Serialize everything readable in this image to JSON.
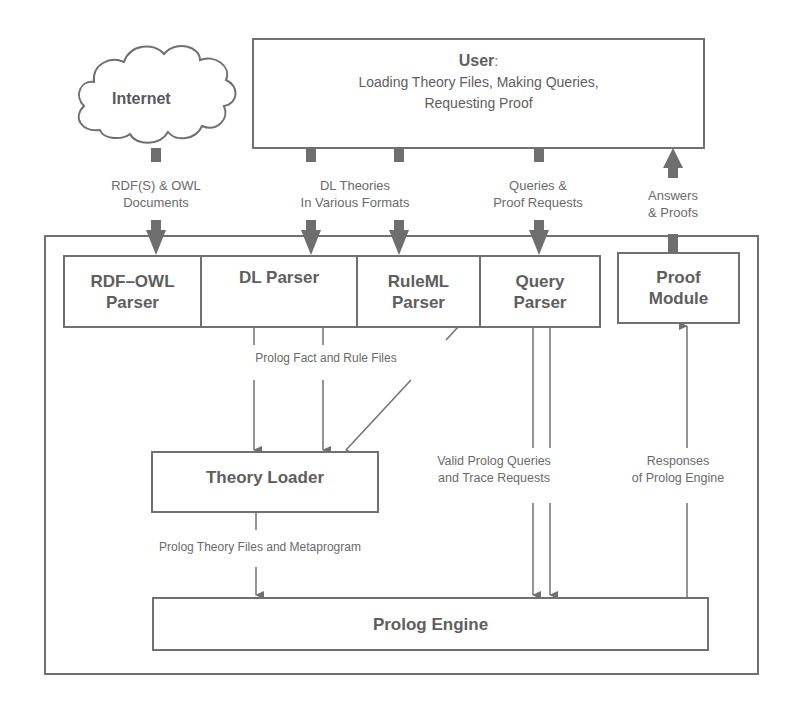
{
  "diagram": {
    "type": "system-architecture",
    "external": {
      "internet": {
        "label": "Internet",
        "shape": "cloud"
      },
      "user": {
        "title": "User",
        "title_suffix": ":",
        "line1": "Loading Theory Files, Making Queries,",
        "line2": "Requesting Proof"
      }
    },
    "components": {
      "rdf_owl_parser": {
        "line1": "RDF–OWL",
        "line2": "Parser"
      },
      "dl_parser": {
        "line1": "DL Parser"
      },
      "ruleml_parser": {
        "line1": "RuleML",
        "line2": "Parser"
      },
      "query_parser": {
        "line1": "Query",
        "line2": "Parser"
      },
      "proof_module": {
        "line1": "Proof",
        "line2": "Module"
      },
      "theory_loader": {
        "line1": "Theory Loader"
      },
      "prolog_engine": {
        "line1": "Prolog Engine"
      }
    },
    "flows": {
      "rdf_owl_docs": {
        "line1": "RDF(S) & OWL",
        "line2": "Documents"
      },
      "dl_theories": {
        "line1": "DL Theories",
        "line2": "In Various Formats"
      },
      "queries_proof": {
        "line1": "Queries &",
        "line2": "Proof Requests"
      },
      "answers_proofs": {
        "line1": "Answers",
        "line2": "& Proofs"
      },
      "fact_rule_files": {
        "line1": "Prolog Fact and Rule Files"
      },
      "valid_queries": {
        "line1": "Valid Prolog Queries",
        "line2": "and Trace Requests"
      },
      "responses": {
        "line1": "Responses",
        "line2": "of Prolog Engine"
      },
      "theory_files_meta": {
        "line1": "Prolog Theory Files and Metaprogram"
      }
    },
    "edges": [
      {
        "from": "Internet",
        "to": "RDF-OWL Parser",
        "label": "RDF(S) & OWL Documents"
      },
      {
        "from": "User",
        "to": "DL Parser",
        "label": "DL Theories In Various Formats"
      },
      {
        "from": "User",
        "to": "RuleML Parser",
        "label": "DL Theories In Various Formats"
      },
      {
        "from": "User",
        "to": "Query Parser",
        "label": "Queries & Proof Requests"
      },
      {
        "from": "Proof Module",
        "to": "User",
        "label": "Answers & Proofs"
      },
      {
        "from": "DL Parser",
        "to": "Theory Loader",
        "label": "Prolog Fact and Rule Files"
      },
      {
        "from": "RuleML Parser",
        "to": "Theory Loader",
        "label": "Prolog Fact and Rule Files"
      },
      {
        "from": "Theory Loader",
        "to": "Prolog Engine",
        "label": "Prolog Theory Files and Metaprogram"
      },
      {
        "from": "Query Parser",
        "to": "Prolog Engine",
        "label": "Valid Prolog Queries and Trace Requests"
      },
      {
        "from": "Prolog Engine",
        "to": "Proof Module",
        "label": "Responses of Prolog Engine"
      }
    ],
    "colors": {
      "stroke": "#707070",
      "thick_arrow": "#6e6e6e",
      "text": "#5e5e5e"
    }
  }
}
